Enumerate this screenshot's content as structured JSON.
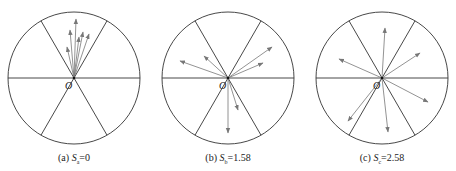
{
  "top_strip_text": "",
  "colors": {
    "circle": "#333333",
    "sector": "#333333",
    "arrow": "#777777",
    "origin_dot": "#111111"
  },
  "origin_label": "O",
  "panels": [
    {
      "id": "a",
      "center": [
        74,
        78
      ],
      "radius": 66,
      "caption_prefix": "(a) ",
      "caption_var": "S",
      "caption_sub": "a",
      "caption_value": "=0",
      "arrows": [
        [
          67,
          47
        ],
        [
          70,
          30
        ],
        [
          76,
          19
        ],
        [
          79,
          37
        ],
        [
          83,
          32
        ],
        [
          89,
          34
        ]
      ]
    },
    {
      "id": "b",
      "center": [
        228,
        78
      ],
      "radius": 66,
      "caption_prefix": "(b) ",
      "caption_var": "S",
      "caption_sub": "b",
      "caption_value": "=1.58",
      "arrows": [
        [
          180,
          61
        ],
        [
          204,
          56
        ],
        [
          272,
          47
        ],
        [
          263,
          63
        ],
        [
          238,
          110
        ],
        [
          228,
          133
        ]
      ]
    },
    {
      "id": "c",
      "center": [
        382,
        78
      ],
      "radius": 66,
      "caption_prefix": "(c) ",
      "caption_var": "S",
      "caption_sub": "c",
      "caption_value": "=2.58",
      "arrows": [
        [
          385,
          28
        ],
        [
          339,
          59
        ],
        [
          420,
          53
        ],
        [
          428,
          102
        ],
        [
          348,
          121
        ],
        [
          388,
          132
        ]
      ]
    }
  ]
}
